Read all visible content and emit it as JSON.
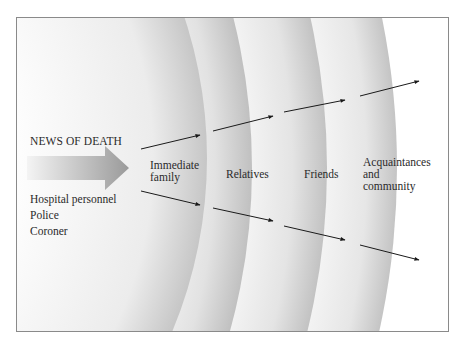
{
  "diagram": {
    "source_label": "NEWS OF DEATH",
    "sources": [
      "Hospital personnel",
      "Police",
      "Coroner"
    ],
    "circles": [
      {
        "label": "Immediate family",
        "lines": [
          "Immediate",
          "family"
        ]
      },
      {
        "label": "Relatives",
        "lines": [
          "Relatives"
        ]
      },
      {
        "label": "Friends",
        "lines": [
          "Friends"
        ]
      },
      {
        "label": "Acquaintances and community",
        "lines": [
          "Acquaintances",
          "and",
          "community"
        ]
      }
    ],
    "colors": {
      "band_light": "#ffffff",
      "band_shade": "#c8c8c8",
      "arrow": "#1a1a1a",
      "frame": "#8a8a8a",
      "text": "#2a2a2a"
    }
  }
}
